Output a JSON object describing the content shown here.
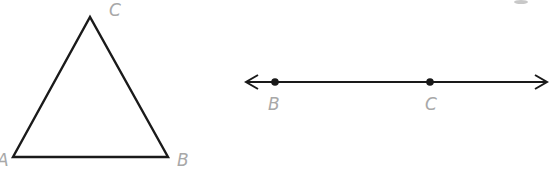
{
  "figures": {
    "triangle": {
      "vertices": [
        {
          "label": "A",
          "x": 13,
          "y": 157
        },
        {
          "label": "B",
          "x": 168,
          "y": 157
        },
        {
          "label": "C",
          "x": 90,
          "y": 17
        }
      ]
    },
    "line": {
      "y": 82,
      "x_start": 245,
      "x_end": 548,
      "points": [
        {
          "label": "B",
          "x": 275
        },
        {
          "label": "C",
          "x": 430
        }
      ]
    }
  },
  "labels": {
    "tri_a": "A",
    "tri_b": "B",
    "tri_c": "C",
    "line_b": "B",
    "line_c": "C"
  },
  "colors": {
    "stroke": "#1a1a1a",
    "label": "#a8a8a8"
  }
}
